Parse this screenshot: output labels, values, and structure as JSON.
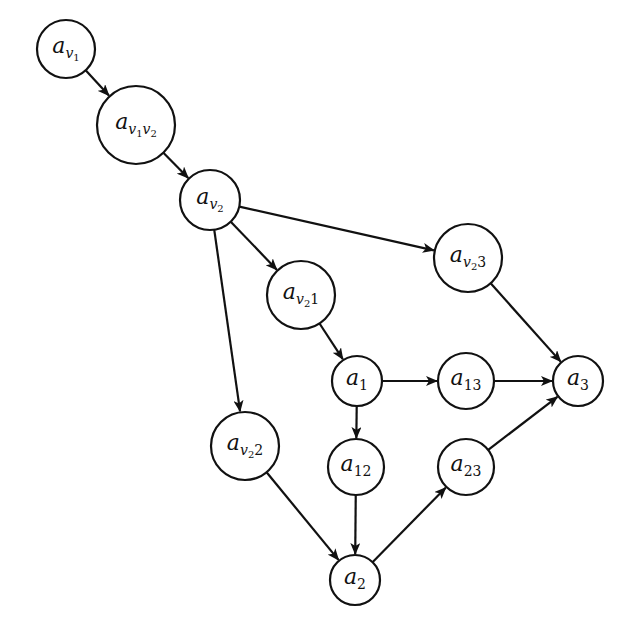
{
  "diagram": {
    "type": "directed-graph",
    "nodes": [
      {
        "id": "av1",
        "base": "a",
        "sub": "v",
        "subsub": "1",
        "tail": "",
        "cx": 66,
        "cy": 49,
        "r": 29
      },
      {
        "id": "av1v2",
        "base": "a",
        "sub": "v",
        "subsub": "1",
        "sub2": "v",
        "subsub2": "2",
        "tail": "",
        "cx": 136,
        "cy": 125,
        "r": 39
      },
      {
        "id": "av2",
        "base": "a",
        "sub": "v",
        "subsub": "2",
        "tail": "",
        "cx": 210,
        "cy": 200,
        "r": 30
      },
      {
        "id": "av23",
        "base": "a",
        "sub": "v",
        "subsub": "2",
        "tail": "3",
        "cx": 468,
        "cy": 258,
        "r": 34
      },
      {
        "id": "av21",
        "base": "a",
        "sub": "v",
        "subsub": "2",
        "tail": "1",
        "cx": 301,
        "cy": 295,
        "r": 34
      },
      {
        "id": "a1",
        "base": "a",
        "num": "1",
        "cx": 357,
        "cy": 381,
        "r": 25
      },
      {
        "id": "a13",
        "base": "a",
        "num": "13",
        "cx": 466,
        "cy": 381,
        "r": 28
      },
      {
        "id": "a3",
        "base": "a",
        "num": "3",
        "cx": 578,
        "cy": 381,
        "r": 25
      },
      {
        "id": "av22",
        "base": "a",
        "sub": "v",
        "subsub": "2",
        "tail": "2",
        "cx": 245,
        "cy": 446,
        "r": 34
      },
      {
        "id": "a12",
        "base": "a",
        "num": "12",
        "cx": 356,
        "cy": 467,
        "r": 28
      },
      {
        "id": "a23",
        "base": "a",
        "num": "23",
        "cx": 466,
        "cy": 467,
        "r": 28
      },
      {
        "id": "a2",
        "base": "a",
        "num": "2",
        "cx": 355,
        "cy": 580,
        "r": 25
      }
    ],
    "edges": [
      {
        "from": "av1",
        "to": "av1v2"
      },
      {
        "from": "av1v2",
        "to": "av2"
      },
      {
        "from": "av2",
        "to": "av23"
      },
      {
        "from": "av2",
        "to": "av21"
      },
      {
        "from": "av2",
        "to": "av22"
      },
      {
        "from": "av21",
        "to": "a1"
      },
      {
        "from": "a1",
        "to": "a13"
      },
      {
        "from": "a1",
        "to": "a12"
      },
      {
        "from": "a13",
        "to": "a3"
      },
      {
        "from": "av23",
        "to": "a3"
      },
      {
        "from": "av22",
        "to": "a2"
      },
      {
        "from": "a12",
        "to": "a2"
      },
      {
        "from": "a2",
        "to": "a23"
      },
      {
        "from": "a23",
        "to": "a3"
      }
    ],
    "colors": {
      "stroke": "#111111",
      "background": "#ffffff",
      "node_fill": "#ffffff"
    }
  }
}
